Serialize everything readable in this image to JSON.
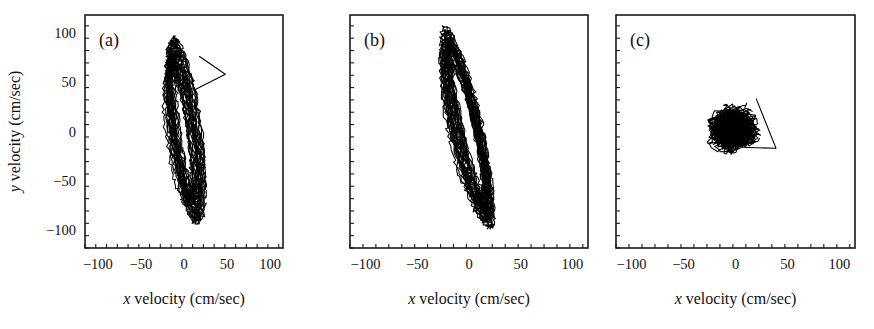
{
  "figure": {
    "background_color": "#ffffff",
    "ink_color": "#000000",
    "width": 874,
    "height": 329
  },
  "chart_data": {
    "type": "line",
    "title": "",
    "subtitle": "",
    "panel_count": 3,
    "shared_xlabel_plain": "x velocity (cm/sec)",
    "shared_xlabel_italic_part": "x",
    "shared_xlabel_rest": " velocity (cm/sec)",
    "shared_ylabel_plain": "y velocity (cm/sec)",
    "shared_ylabel_italic_part": "y",
    "shared_ylabel_rest": " velocity (cm/sec)",
    "xlim": [
      -115,
      115
    ],
    "ylim": [
      -118,
      118
    ],
    "xticks_major": [
      -100,
      -50,
      0,
      50,
      100
    ],
    "yticks_major": [
      100,
      50,
      0,
      -50,
      -100
    ],
    "xtick_labels": [
      "-100",
      "-50",
      "0",
      "50",
      "100"
    ],
    "ytick_labels": [
      "100",
      "50",
      "0",
      "-50",
      "-100"
    ],
    "xtick_minor_step": 12.5,
    "ytick_minor_step": 12.5,
    "grid": false,
    "legend": false,
    "ylabel_only_on_panel": "a",
    "panels": [
      {
        "id": "a",
        "label": "(a)",
        "description": "dense elongated tilted loop bundle, phase plane trajectory",
        "x_range_data": [
          -24,
          48
        ],
        "y_range_data": [
          -92,
          90
        ],
        "loop_center": [
          0,
          0
        ],
        "loop_semi_major_y": 88,
        "loop_semi_minor_x": 13,
        "loop_tilt_deg": 9,
        "n_loops": 26,
        "excursion": {
          "present": true,
          "apex_xy": [
            48,
            58
          ],
          "from_xy": [
            18,
            76
          ],
          "to_xy": [
            12,
            42
          ]
        }
      },
      {
        "id": "b",
        "label": "(b)",
        "description": "narrow near-vertical ellipse bundle, phase plane trajectory",
        "x_range_data": [
          -26,
          22
        ],
        "y_range_data": [
          -94,
          101
        ],
        "loop_center": [
          -2,
          2
        ],
        "loop_semi_major_y": 96,
        "loop_semi_minor_x": 11,
        "loop_tilt_deg": 12,
        "n_loops": 28,
        "excursion": {
          "present": false,
          "apex_xy": [
            0,
            0
          ],
          "from_xy": [
            0,
            0
          ],
          "to_xy": [
            0,
            0
          ]
        }
      },
      {
        "id": "c",
        "label": "(c)",
        "description": "compact dense scribble blob near origin with one rightward excursion",
        "x_range_data": [
          -26,
          40
        ],
        "y_range_data": [
          -26,
          36
        ],
        "loop_center": [
          -2,
          2
        ],
        "loop_semi_major_y": 17,
        "loop_semi_minor_x": 13,
        "loop_tilt_deg": 10,
        "n_loops": 34,
        "excursion": {
          "present": true,
          "apex_xy": [
            39,
            -17
          ],
          "from_xy": [
            20,
            33
          ],
          "to_xy": [
            6,
            -16
          ]
        }
      }
    ]
  }
}
